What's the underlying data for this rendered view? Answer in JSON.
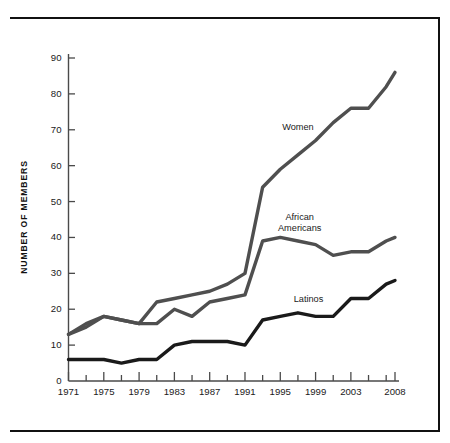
{
  "chart_data": {
    "type": "line",
    "title": "",
    "xlabel": "",
    "ylabel": "NUMBER OF MEMBERS",
    "xlim": [
      1971,
      2008
    ],
    "ylim": [
      0,
      90
    ],
    "grid": false,
    "legend_position": "inline-annotations",
    "y_ticks": [
      0,
      10,
      20,
      30,
      40,
      50,
      60,
      70,
      80,
      90
    ],
    "y_tick_labels": [
      "0",
      "10",
      "20",
      "30",
      "40",
      "50",
      "60",
      "70",
      "80",
      "90"
    ],
    "x_ticks": [
      1971,
      1973,
      1975,
      1977,
      1979,
      1981,
      1983,
      1985,
      1987,
      1989,
      1991,
      1993,
      1995,
      1997,
      1999,
      2001,
      2003,
      2005,
      2007,
      2008
    ],
    "x_tick_labels_shown": [
      "1971",
      "1975",
      "1979",
      "1983",
      "1987",
      "1991",
      "1995",
      "1999",
      "2003",
      "2008"
    ],
    "x_labeled_ticks": [
      1971,
      1975,
      1979,
      1983,
      1987,
      1991,
      1995,
      1999,
      2003,
      2008
    ],
    "series": [
      {
        "name": "Women",
        "color": "#4f4f4f",
        "line_width": 3.4,
        "label_text": "Women",
        "x": [
          1971,
          1973,
          1975,
          1977,
          1979,
          1981,
          1983,
          1985,
          1987,
          1989,
          1991,
          1993,
          1995,
          1997,
          1999,
          2001,
          2003,
          2005,
          2007,
          2008
        ],
        "values": [
          13,
          16,
          18,
          17,
          16,
          22,
          23,
          24,
          25,
          27,
          30,
          54,
          59,
          63,
          67,
          72,
          76,
          76,
          82,
          86
        ]
      },
      {
        "name": "African Americans",
        "color": "#4f4f4f",
        "line_width": 3.4,
        "label_text": "African\nAmericans",
        "x": [
          1971,
          1973,
          1975,
          1977,
          1979,
          1981,
          1983,
          1985,
          1987,
          1989,
          1991,
          1993,
          1995,
          1997,
          1999,
          2001,
          2003,
          2005,
          2007,
          2008
        ],
        "values": [
          13,
          15,
          18,
          17,
          16,
          16,
          20,
          18,
          22,
          23,
          24,
          39,
          40,
          39,
          38,
          35,
          36,
          36,
          39,
          40
        ]
      },
      {
        "name": "Latinos",
        "color": "#1a1a1a",
        "line_width": 3.4,
        "label_text": "Latinos",
        "x": [
          1971,
          1973,
          1975,
          1977,
          1979,
          1981,
          1983,
          1985,
          1987,
          1989,
          1991,
          1993,
          1995,
          1997,
          1999,
          2001,
          2003,
          2005,
          2007,
          2008
        ],
        "values": [
          6,
          6,
          6,
          5,
          6,
          6,
          10,
          11,
          11,
          11,
          10,
          17,
          18,
          19,
          18,
          18,
          23,
          23,
          27,
          28
        ]
      }
    ],
    "annotations": [
      {
        "text": "Women",
        "x_year": 1997,
        "y_value": 70
      },
      {
        "text": "African",
        "x_year": 1997,
        "y_value": 45
      },
      {
        "text": "Americans",
        "x_year": 1997,
        "y_value": 42.5
      },
      {
        "text": "Latinos",
        "x_year": 1998,
        "y_value": 22
      }
    ]
  },
  "axis": {
    "y_label": "NUMBER OF MEMBERS",
    "y_tick_labels": [
      "90",
      "80",
      "70",
      "60",
      "50",
      "40",
      "30",
      "20",
      "10",
      "0"
    ],
    "x_tick_labels": [
      "1971",
      "1975",
      "1979",
      "1983",
      "1987",
      "1991",
      "1995",
      "1999",
      "2003",
      "2008"
    ]
  },
  "series_labels": {
    "women": "Women",
    "african_line1": "African",
    "african_line2": "Americans",
    "latinos": "Latinos"
  },
  "style": {
    "frame_color": "#111111",
    "axis_color": "#4a4a4a",
    "gray_series_color": "#4f4f4f",
    "black_series_color": "#1a1a1a",
    "background": "#ffffff"
  }
}
